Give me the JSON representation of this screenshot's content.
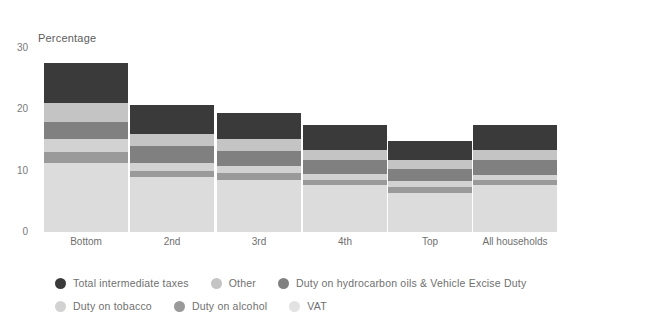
{
  "chart_data": {
    "type": "bar",
    "title": "",
    "subtitle": "",
    "ylabel": "Percentage",
    "xlabel": "",
    "ylim": [
      0,
      30
    ],
    "yticks": [
      0,
      10,
      20,
      30
    ],
    "grid": false,
    "stacked": true,
    "legend_position": "bottom",
    "categories": [
      "Bottom",
      "2nd",
      "3rd",
      "4th",
      "Top",
      "All households"
    ],
    "series": [
      {
        "name": "VAT",
        "color": "#dcdcdc",
        "values": [
          11.3,
          8.9,
          8.5,
          7.7,
          6.4,
          7.6
        ]
      },
      {
        "name": "Duty on alcohol",
        "color": "#9a9a9a",
        "values": [
          1.8,
          1.0,
          1.2,
          0.8,
          0.9,
          0.9
        ]
      },
      {
        "name": "Duty on tobacco",
        "color": "#d2d2d2",
        "values": [
          2.0,
          1.3,
          1.1,
          0.9,
          1.0,
          0.8
        ]
      },
      {
        "name": "Duty on hydrocarbon oils & Vehicle Excise Duty",
        "color": "#808080",
        "values": [
          2.9,
          2.8,
          2.4,
          2.3,
          2.0,
          2.4
        ]
      },
      {
        "name": "Other",
        "color": "#c4c4c4",
        "values": [
          3.1,
          2.0,
          2.0,
          1.6,
          1.5,
          1.6
        ]
      },
      {
        "name": "Total intermediate taxes",
        "color": "#3a3a3a",
        "values": [
          6.4,
          4.7,
          4.2,
          4.1,
          3.1,
          4.1
        ]
      }
    ],
    "totals": [
      27.4,
      20.7,
      19.4,
      17.4,
      14.9,
      17.4
    ]
  },
  "axis": {
    "y_title": "Percentage",
    "y_ticks": [
      "30",
      "20",
      "10",
      "0"
    ]
  },
  "categories": [
    {
      "label": "Bottom"
    },
    {
      "label": "2nd"
    },
    {
      "label": "3rd"
    },
    {
      "label": "4th"
    },
    {
      "label": "Top"
    },
    {
      "label": "All households"
    }
  ],
  "legend": {
    "row1": [
      {
        "label": "Total intermediate taxes",
        "color": "#3a3a3a"
      },
      {
        "label": "Other",
        "color": "#c4c4c4"
      },
      {
        "label": "Duty on hydrocarbon oils & Vehicle Excise Duty",
        "color": "#808080"
      }
    ],
    "row2": [
      {
        "label": "Duty on tobacco",
        "color": "#d2d2d2"
      },
      {
        "label": "Duty on alcohol",
        "color": "#9a9a9a"
      },
      {
        "label": "VAT",
        "color": "#e2e2e2"
      }
    ]
  }
}
